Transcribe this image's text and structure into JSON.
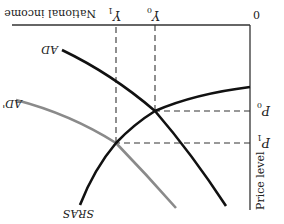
{
  "diagram": {
    "type": "AD-AS macroeconomic diagram (rendered rotated 180°)",
    "orientation": "upside-down",
    "axes": {
      "x_label": "National income",
      "y_label": "Price level",
      "origin_label": "0"
    },
    "ticks": {
      "x": [
        {
          "label": "Y",
          "sub": "0"
        },
        {
          "label": "Y",
          "sub": "1"
        }
      ],
      "y": [
        {
          "label": "P",
          "sub": "0"
        },
        {
          "label": "P",
          "sub": "1"
        }
      ]
    },
    "curves": [
      {
        "name": "SRAS",
        "label": "SRAS",
        "color": "#111111",
        "width": 2.6
      },
      {
        "name": "AD",
        "label": "AD",
        "color": "#111111",
        "width": 2.6
      },
      {
        "name": "AD'",
        "label": "AD'",
        "color": "#8a8a8a",
        "width": 2.6
      }
    ],
    "equilibria": [
      {
        "label": "E0",
        "x": "Y0",
        "y": "P0",
        "curves": [
          "AD",
          "SRAS"
        ]
      },
      {
        "label": "E1",
        "x": "Y1",
        "y": "P1",
        "curves": [
          "AD'",
          "SRAS"
        ]
      }
    ],
    "colors": {
      "primary": "#111111",
      "shifted": "#8a8a8a",
      "guides": "#333333",
      "background": "#ffffff"
    }
  }
}
